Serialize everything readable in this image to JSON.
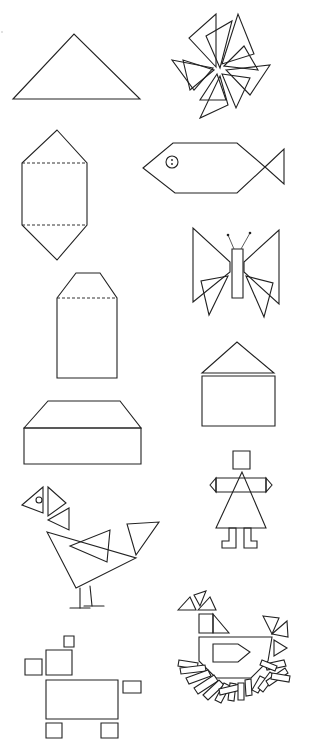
{
  "page": {
    "width": 309,
    "height": 752,
    "background": "#ffffff",
    "ink_color": "#222222"
  },
  "figures": [
    {
      "id": "triangle",
      "label": "large triangle",
      "polygons": [
        [
          [
            13,
            99
          ],
          [
            74,
            34
          ],
          [
            140,
            99
          ]
        ]
      ]
    },
    {
      "id": "pinwheel",
      "label": "pinwheel of triangles",
      "polygons": [
        [
          [
            216,
            67
          ],
          [
            189,
            38
          ],
          [
            216,
            14
          ]
        ],
        [
          [
            220,
            68
          ],
          [
            206,
            36
          ],
          [
            232,
            21
          ]
        ],
        [
          [
            222,
            64
          ],
          [
            238,
            14
          ],
          [
            254,
            54
          ]
        ],
        [
          [
            224,
            66
          ],
          [
            244,
            46
          ],
          [
            258,
            70
          ]
        ],
        [
          [
            226,
            70
          ],
          [
            270,
            65
          ],
          [
            250,
            95
          ]
        ],
        [
          [
            222,
            74
          ],
          [
            250,
            78
          ],
          [
            236,
            108
          ]
        ],
        [
          [
            220,
            76
          ],
          [
            228,
            105
          ],
          [
            200,
            118
          ]
        ],
        [
          [
            217,
            74
          ],
          [
            200,
            100
          ],
          [
            226,
            100
          ]
        ],
        [
          [
            214,
            70
          ],
          [
            190,
            90
          ],
          [
            183,
            60
          ]
        ],
        [
          [
            213,
            68
          ],
          [
            172,
            60
          ],
          [
            194,
            90
          ]
        ]
      ]
    },
    {
      "id": "hexagon-prism",
      "label": "elongated hexagon with dashed folds",
      "polygons": [
        [
          [
            57,
            130
          ],
          [
            87,
            163
          ],
          [
            87,
            225
          ],
          [
            57,
            260
          ],
          [
            22,
            225
          ],
          [
            22,
            163
          ]
        ]
      ],
      "dashed": [
        [
          [
            22,
            163
          ],
          [
            87,
            163
          ]
        ],
        [
          [
            22,
            225
          ],
          [
            87,
            225
          ]
        ]
      ]
    },
    {
      "id": "fish",
      "label": "fish",
      "polygons": [
        [
          [
            143,
            168
          ],
          [
            173,
            143
          ],
          [
            237,
            143
          ],
          [
            265,
            167
          ],
          [
            237,
            193
          ],
          [
            175,
            193
          ]
        ],
        [
          [
            265,
            167
          ],
          [
            284,
            149
          ],
          [
            284,
            184
          ]
        ]
      ],
      "eye": {
        "cx": 172,
        "cy": 162,
        "r": 6
      }
    },
    {
      "id": "butterfly",
      "label": "butterfly",
      "polygons": [
        [
          [
            193,
            228
          ],
          [
            193,
            302
          ],
          [
            230,
            272
          ],
          [
            230,
            262
          ]
        ],
        [
          [
            279,
            230
          ],
          [
            279,
            304
          ],
          [
            244,
            272
          ],
          [
            244,
            262
          ]
        ],
        [
          [
            232,
            249
          ],
          [
            243,
            249
          ],
          [
            243,
            298
          ],
          [
            232,
            298
          ]
        ],
        [
          [
            228,
            276
          ],
          [
            201,
            281
          ],
          [
            209,
            315
          ]
        ],
        [
          [
            246,
            276
          ],
          [
            273,
            283
          ],
          [
            264,
            317
          ]
        ]
      ],
      "antennae": [
        [
          [
            234,
            249
          ],
          [
            228,
            235
          ]
        ],
        [
          [
            241,
            249
          ],
          [
            250,
            233
          ]
        ]
      ]
    },
    {
      "id": "tall-pentagon-box",
      "label": "tall box with pointed top",
      "polygons": [
        [
          [
            57,
            298
          ],
          [
            76,
            273
          ],
          [
            100,
            273
          ],
          [
            117,
            298
          ],
          [
            117,
            378
          ],
          [
            57,
            378
          ]
        ]
      ],
      "dashed": [
        [
          [
            57,
            298
          ],
          [
            117,
            298
          ]
        ]
      ]
    },
    {
      "id": "house",
      "label": "house",
      "polygons": [
        [
          [
            202,
            373
          ],
          [
            237,
            342
          ],
          [
            274,
            373
          ]
        ],
        [
          [
            202,
            376
          ],
          [
            275,
            376
          ],
          [
            275,
            426
          ],
          [
            202,
            426
          ]
        ]
      ]
    },
    {
      "id": "flat-box",
      "label": "wide box with trapezoid top",
      "polygons": [
        [
          [
            24,
            428
          ],
          [
            48,
            401
          ],
          [
            120,
            401
          ],
          [
            141,
            428
          ]
        ],
        [
          [
            24,
            428
          ],
          [
            141,
            428
          ],
          [
            141,
            464
          ],
          [
            24,
            464
          ]
        ]
      ]
    },
    {
      "id": "person",
      "label": "person figure",
      "polygons": [
        [
          [
            233,
            451
          ],
          [
            250,
            451
          ],
          [
            250,
            469
          ],
          [
            233,
            469
          ]
        ],
        [
          [
            216,
            478
          ],
          [
            266,
            478
          ],
          [
            266,
            492
          ],
          [
            216,
            492
          ]
        ],
        [
          [
            210,
            485
          ],
          [
            216,
            478
          ],
          [
            216,
            492
          ]
        ],
        [
          [
            266,
            478
          ],
          [
            272,
            485
          ],
          [
            266,
            492
          ]
        ],
        [
          [
            242,
            472
          ],
          [
            216,
            528
          ],
          [
            266,
            528
          ]
        ],
        [
          [
            229,
            528
          ],
          [
            236,
            528
          ],
          [
            236,
            548
          ],
          [
            222,
            548
          ],
          [
            222,
            541
          ],
          [
            229,
            541
          ]
        ],
        [
          [
            244,
            528
          ],
          [
            251,
            528
          ],
          [
            251,
            541
          ],
          [
            257,
            541
          ],
          [
            257,
            548
          ],
          [
            244,
            548
          ]
        ]
      ]
    },
    {
      "id": "rooster",
      "label": "bird made of triangles",
      "polygons": [
        [
          [
            22,
            505
          ],
          [
            43,
            487
          ],
          [
            43,
            513
          ]
        ],
        [
          [
            48,
            487
          ],
          [
            66,
            503
          ],
          [
            48,
            516
          ]
        ],
        [
          [
            48,
            520
          ],
          [
            69,
            508
          ],
          [
            69,
            530
          ]
        ],
        [
          [
            47,
            532
          ],
          [
            136,
            558
          ],
          [
            76,
            588
          ]
        ],
        [
          [
            70,
            546
          ],
          [
            110,
            530
          ],
          [
            107,
            562
          ]
        ],
        [
          [
            127,
            524
          ],
          [
            159,
            522
          ],
          [
            136,
            555
          ]
        ]
      ],
      "eye": {
        "cx": 39,
        "cy": 500,
        "r": 3
      },
      "legs": [
        [
          [
            80,
            588
          ],
          [
            80,
            608
          ]
        ],
        [
          [
            90,
            586
          ],
          [
            92,
            606
          ]
        ],
        [
          [
            70,
            608
          ],
          [
            90,
            608
          ]
        ],
        [
          [
            84,
            606
          ],
          [
            104,
            606
          ]
        ]
      ]
    },
    {
      "id": "hen-on-nest",
      "label": "hen sitting on nest",
      "polygons": [
        [
          [
            178,
            610
          ],
          [
            190,
            597
          ],
          [
            196,
            610
          ]
        ],
        [
          [
            194,
            595
          ],
          [
            206,
            591
          ],
          [
            200,
            606
          ]
        ],
        [
          [
            198,
            610
          ],
          [
            210,
            597
          ],
          [
            216,
            610
          ]
        ],
        [
          [
            199,
            614
          ],
          [
            213,
            614
          ],
          [
            213,
            633
          ],
          [
            199,
            633
          ]
        ],
        [
          [
            213,
            614
          ],
          [
            229,
            633
          ],
          [
            213,
            633
          ]
        ],
        [
          [
            199,
            637
          ],
          [
            272,
            637
          ],
          [
            268,
            661
          ],
          [
            251,
            678
          ],
          [
            216,
            678
          ],
          [
            199,
            661
          ]
        ],
        [
          [
            213,
            644
          ],
          [
            238,
            644
          ],
          [
            250,
            652
          ],
          [
            238,
            662
          ],
          [
            213,
            662
          ]
        ],
        [
          [
            263,
            616
          ],
          [
            279,
            618
          ],
          [
            272,
            634
          ]
        ],
        [
          [
            272,
            634
          ],
          [
            287,
            621
          ],
          [
            288,
            637
          ]
        ],
        [
          [
            274,
            640
          ],
          [
            287,
            648
          ],
          [
            274,
            656
          ]
        ]
      ],
      "sticks": [
        [
          [
            179,
            660
          ],
          [
            198,
            663
          ],
          [
            197,
            669
          ],
          [
            178,
            666
          ]
        ],
        [
          [
            180,
            668
          ],
          [
            205,
            665
          ],
          [
            206,
            671
          ],
          [
            181,
            674
          ]
        ],
        [
          [
            186,
            678
          ],
          [
            208,
            670
          ],
          [
            211,
            676
          ],
          [
            189,
            684
          ]
        ],
        [
          [
            194,
            688
          ],
          [
            214,
            675
          ],
          [
            218,
            681
          ],
          [
            198,
            694
          ]
        ],
        [
          [
            203,
            695
          ],
          [
            219,
            680
          ],
          [
            224,
            685
          ],
          [
            208,
            700
          ]
        ],
        [
          [
            215,
            700
          ],
          [
            224,
            683
          ],
          [
            230,
            686
          ],
          [
            221,
            703
          ]
        ],
        [
          [
            228,
            700
          ],
          [
            230,
            683
          ],
          [
            236,
            684
          ],
          [
            234,
            701
          ]
        ],
        [
          [
            219,
            689
          ],
          [
            240,
            684
          ],
          [
            241,
            690
          ],
          [
            220,
            695
          ]
        ],
        [
          [
            238,
            700
          ],
          [
            238,
            683
          ],
          [
            244,
            683
          ],
          [
            244,
            700
          ]
        ],
        [
          [
            246,
            696
          ],
          [
            245,
            680
          ],
          [
            251,
            679
          ],
          [
            252,
            695
          ]
        ],
        [
          [
            252,
            690
          ],
          [
            260,
            676
          ],
          [
            266,
            679
          ],
          [
            258,
            693
          ]
        ],
        [
          [
            258,
            688
          ],
          [
            270,
            672
          ],
          [
            275,
            676
          ],
          [
            263,
            692
          ]
        ],
        [
          [
            266,
            681
          ],
          [
            285,
            668
          ],
          [
            288,
            673
          ],
          [
            269,
            686
          ]
        ],
        [
          [
            265,
            664
          ],
          [
            284,
            660
          ],
          [
            286,
            666
          ],
          [
            267,
            670
          ]
        ],
        [
          [
            272,
            673
          ],
          [
            290,
            676
          ],
          [
            289,
            682
          ],
          [
            271,
            679
          ]
        ],
        [
          [
            262,
            660
          ],
          [
            277,
            666
          ],
          [
            275,
            671
          ],
          [
            260,
            665
          ]
        ]
      ]
    },
    {
      "id": "dog",
      "label": "animal made of squares and rectangles",
      "polygons": [
        [
          [
            64,
            636
          ],
          [
            74,
            636
          ],
          [
            74,
            647
          ],
          [
            64,
            647
          ]
        ],
        [
          [
            46,
            650
          ],
          [
            72,
            650
          ],
          [
            72,
            675
          ],
          [
            46,
            675
          ]
        ],
        [
          [
            25,
            659
          ],
          [
            42,
            659
          ],
          [
            42,
            675
          ],
          [
            25,
            675
          ]
        ],
        [
          [
            46,
            680
          ],
          [
            118,
            680
          ],
          [
            118,
            719
          ],
          [
            46,
            719
          ]
        ],
        [
          [
            123,
            681
          ],
          [
            141,
            681
          ],
          [
            141,
            693
          ],
          [
            123,
            693
          ]
        ],
        [
          [
            46,
            723
          ],
          [
            62,
            723
          ],
          [
            62,
            738
          ],
          [
            46,
            738
          ]
        ],
        [
          [
            101,
            723
          ],
          [
            118,
            723
          ],
          [
            118,
            738
          ],
          [
            101,
            738
          ]
        ]
      ]
    }
  ],
  "stray_mark": {
    "cx": 2,
    "cy": 32,
    "r": 0.8
  }
}
